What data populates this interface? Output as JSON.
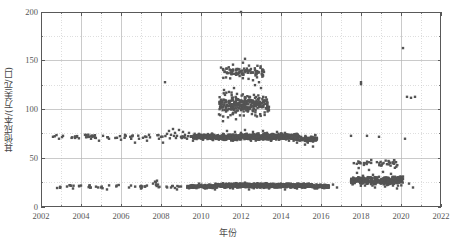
{
  "chart_data": {
    "type": "scatter",
    "title": "",
    "xlabel": "年份",
    "ylabel": "其他成本/(万美元/口)",
    "xlim": [
      2002,
      2022
    ],
    "ylim": [
      0,
      200
    ],
    "xticks": [
      2002,
      2004,
      2006,
      2008,
      2010,
      2012,
      2014,
      2016,
      2018,
      2020,
      2022
    ],
    "yticks": [
      0,
      50,
      100,
      150,
      200
    ],
    "y_minor_ticks": [
      25,
      75,
      125,
      175
    ],
    "grid": "major solid light-gray, minor dotted light-gray",
    "legend": "none",
    "marker": {
      "shape": "square",
      "color": "#545454",
      "size_px": 2.4
    },
    "series": [
      {
        "name": "其他成本",
        "points": [
          [
            2002.6,
            72
          ],
          [
            2002.9,
            70
          ],
          [
            2003.1,
            73
          ],
          [
            2003.3,
            21
          ],
          [
            2003.6,
            19
          ],
          [
            2004.0,
            22
          ],
          [
            2004.2,
            74
          ],
          [
            2004.4,
            72
          ],
          [
            2004.5,
            70
          ],
          [
            2004.6,
            73
          ],
          [
            2004.7,
            71
          ],
          [
            2004.9,
            68
          ],
          [
            2005.1,
            73
          ],
          [
            2005.4,
            70
          ],
          [
            2005.0,
            20
          ],
          [
            2005.3,
            18
          ],
          [
            2005.8,
            71
          ],
          [
            2006.0,
            69
          ],
          [
            2006.2,
            74
          ],
          [
            2006.4,
            20
          ],
          [
            2006.5,
            22
          ],
          [
            2006.7,
            66
          ],
          [
            2006.9,
            70
          ],
          [
            2007.1,
            71
          ],
          [
            2007.3,
            68
          ],
          [
            2007.4,
            74
          ],
          [
            2007.0,
            19
          ],
          [
            2007.2,
            21
          ],
          [
            2007.6,
            24
          ],
          [
            2007.7,
            26
          ],
          [
            2007.75,
            25
          ],
          [
            2007.8,
            27
          ],
          [
            2007.85,
            23
          ],
          [
            2007.9,
            70
          ],
          [
            2008.0,
            72
          ],
          [
            2008.1,
            66
          ],
          [
            2008.2,
            128
          ],
          [
            2008.3,
            75
          ],
          [
            2008.4,
            78
          ],
          [
            2008.5,
            74
          ],
          [
            2008.6,
            80
          ],
          [
            2008.7,
            76
          ],
          [
            2008.8,
            73
          ],
          [
            2008.9,
            79
          ],
          [
            2009.0,
            72
          ],
          [
            2009.1,
            77
          ],
          [
            2008.5,
            20
          ],
          [
            2008.8,
            18
          ],
          [
            2009.0,
            21
          ],
          [
            2009.2,
            74
          ],
          [
            2009.3,
            70
          ],
          [
            2009.4,
            76
          ],
          [
            2009.5,
            72
          ],
          [
            2009.6,
            68
          ],
          [
            2009.7,
            73
          ],
          [
            2009.8,
            71
          ],
          [
            2009.9,
            75
          ],
          [
            2009.5,
            22
          ],
          [
            2009.7,
            20
          ],
          [
            2009.9,
            24
          ],
          [
            2010.0,
            73
          ],
          [
            2010.1,
            69
          ],
          [
            2010.2,
            71
          ],
          [
            2010.0,
            21
          ],
          [
            2010.2,
            19
          ],
          [
            2010.4,
            23
          ],
          [
            2010.3,
            72
          ],
          [
            2010.5,
            70
          ],
          [
            2010.6,
            74
          ],
          [
            2010.5,
            20
          ],
          [
            2010.6,
            22
          ],
          [
            2010.7,
            18
          ],
          [
            2010.8,
            21
          ],
          [
            2010.9,
            95
          ],
          [
            2011.0,
            110
          ],
          [
            2011.05,
            102
          ],
          [
            2011.1,
            88
          ],
          [
            2011.15,
            120
          ],
          [
            2011.2,
            115
          ],
          [
            2011.25,
            98
          ],
          [
            2011.3,
            105
          ],
          [
            2011.35,
            92
          ],
          [
            2011.4,
            118
          ],
          [
            2011.45,
            108
          ],
          [
            2011.5,
            100
          ],
          [
            2011.55,
            112
          ],
          [
            2011.6,
            96
          ],
          [
            2011.65,
            122
          ],
          [
            2011.7,
            104
          ],
          [
            2011.75,
            90
          ],
          [
            2011.8,
            116
          ],
          [
            2011.85,
            99
          ],
          [
            2011.9,
            107
          ],
          [
            2011.95,
            94
          ],
          [
            2011.0,
            143
          ],
          [
            2011.3,
            138
          ],
          [
            2011.6,
            146
          ],
          [
            2012.0,
            200
          ],
          [
            2012.1,
            148
          ],
          [
            2012.2,
            152
          ],
          [
            2012.3,
            140
          ],
          [
            2012.4,
            145
          ],
          [
            2012.5,
            138
          ],
          [
            2012.6,
            130
          ],
          [
            2012.7,
            125
          ],
          [
            2012.8,
            133
          ],
          [
            2012.9,
            128
          ],
          [
            2013.0,
            122
          ],
          [
            2011.0,
            72
          ],
          [
            2011.1,
            75
          ],
          [
            2011.2,
            69
          ],
          [
            2011.3,
            78
          ],
          [
            2011.4,
            71
          ],
          [
            2011.5,
            74
          ],
          [
            2011.6,
            68
          ],
          [
            2011.7,
            77
          ],
          [
            2011.8,
            70
          ],
          [
            2011.9,
            73
          ],
          [
            2012.0,
            76
          ],
          [
            2012.1,
            72
          ],
          [
            2012.2,
            79
          ],
          [
            2012.3,
            70
          ],
          [
            2012.4,
            74
          ],
          [
            2012.5,
            68
          ],
          [
            2012.6,
            77
          ],
          [
            2012.7,
            71
          ],
          [
            2012.8,
            75
          ],
          [
            2012.9,
            69
          ],
          [
            2013.0,
            73
          ],
          [
            2013.1,
            78
          ],
          [
            2013.2,
            70
          ],
          [
            2013.3,
            76
          ],
          [
            2013.4,
            72
          ],
          [
            2013.5,
            68
          ],
          [
            2013.6,
            74
          ],
          [
            2013.7,
            71
          ],
          [
            2013.8,
            77
          ],
          [
            2013.9,
            69
          ],
          [
            2014.0,
            73
          ],
          [
            2014.1,
            70
          ],
          [
            2014.2,
            76
          ],
          [
            2014.3,
            72
          ],
          [
            2014.4,
            68
          ],
          [
            2014.5,
            74
          ],
          [
            2011.0,
            22
          ],
          [
            2011.2,
            20
          ],
          [
            2011.4,
            24
          ],
          [
            2011.6,
            19
          ],
          [
            2011.8,
            23
          ],
          [
            2012.0,
            21
          ],
          [
            2012.2,
            25
          ],
          [
            2012.4,
            18
          ],
          [
            2012.6,
            22
          ],
          [
            2012.8,
            20
          ],
          [
            2013.0,
            24
          ],
          [
            2013.2,
            21
          ],
          [
            2013.4,
            19
          ],
          [
            2013.6,
            23
          ],
          [
            2013.8,
            20
          ],
          [
            2014.0,
            22
          ],
          [
            2014.2,
            18
          ],
          [
            2014.4,
            24
          ],
          [
            2014.6,
            21
          ],
          [
            2014.8,
            19
          ],
          [
            2015.0,
            23
          ],
          [
            2015.2,
            20
          ],
          [
            2015.4,
            22
          ],
          [
            2014.6,
            70
          ],
          [
            2014.8,
            66
          ],
          [
            2015.0,
            72
          ],
          [
            2015.2,
            64
          ],
          [
            2015.4,
            68
          ],
          [
            2015.6,
            62
          ],
          [
            2015.6,
            21
          ],
          [
            2015.8,
            19
          ],
          [
            2016.6,
            23
          ],
          [
            2016.8,
            20
          ],
          [
            2017.5,
            73
          ],
          [
            2017.6,
            24
          ],
          [
            2017.7,
            28
          ],
          [
            2017.8,
            35
          ],
          [
            2017.9,
            30
          ],
          [
            2018.0,
            26
          ],
          [
            2018.1,
            32
          ],
          [
            2018.2,
            22
          ],
          [
            2018.3,
            29
          ],
          [
            2018.4,
            38
          ],
          [
            2018.5,
            25
          ],
          [
            2018.6,
            33
          ],
          [
            2018.7,
            20
          ],
          [
            2018.8,
            27
          ],
          [
            2018.9,
            31
          ],
          [
            2019.0,
            24
          ],
          [
            2019.1,
            36
          ],
          [
            2019.2,
            21
          ],
          [
            2019.3,
            30
          ],
          [
            2019.4,
            26
          ],
          [
            2019.5,
            34
          ],
          [
            2019.6,
            22
          ],
          [
            2019.7,
            28
          ],
          [
            2019.8,
            19
          ],
          [
            2019.9,
            25
          ],
          [
            2020.0,
            31
          ],
          [
            2018.0,
            128
          ],
          [
            2018.0,
            126
          ],
          [
            2018.3,
            73
          ],
          [
            2018.9,
            72
          ],
          [
            2020.1,
            163
          ],
          [
            2020.3,
            113
          ],
          [
            2020.5,
            112
          ],
          [
            2020.7,
            113
          ],
          [
            2020.2,
            70
          ],
          [
            2020.4,
            24
          ],
          [
            2020.6,
            20
          ]
        ]
      }
    ]
  },
  "axes": {
    "y_tick_labels": [
      "0",
      "50",
      "100",
      "150",
      "200"
    ],
    "x_tick_labels": [
      "2002",
      "2004",
      "2006",
      "2008",
      "2010",
      "2012",
      "2014",
      "2016",
      "2018",
      "2020",
      "2022"
    ]
  },
  "style": {
    "marker_color": "#545454",
    "frame_color": "#595959",
    "major_grid_color": "#b4b4b4",
    "minor_grid_color": "#c8c8c8",
    "background": "#ffffff"
  }
}
